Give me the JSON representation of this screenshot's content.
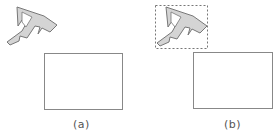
{
  "panels": [
    {
      "id": "a",
      "label": "(a)",
      "has_bounding_box": false
    },
    {
      "id": "b",
      "label": "(b)",
      "has_bounding_box": true
    }
  ],
  "colors": {
    "shape_fill": "#d4d4d4",
    "shape_stroke": "#777777",
    "rect_stroke": "#888888",
    "bbox_stroke": "#777777",
    "label": "#555555"
  }
}
